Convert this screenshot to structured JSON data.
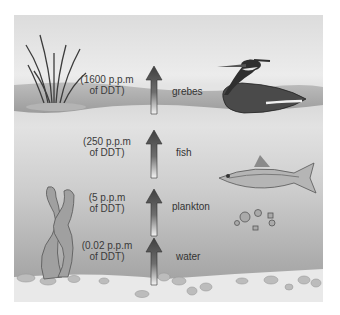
{
  "levels": [
    {
      "organism": "grebes",
      "concentration_line1": "(1600 p.p.m",
      "concentration_line2": "of DDT)"
    },
    {
      "organism": "fish",
      "concentration_line1": "(250 p.p.m",
      "concentration_line2": "of DDT)"
    },
    {
      "organism": "plankton",
      "concentration_line1": "(5 p.p.m",
      "concentration_line2": "of DDT)"
    },
    {
      "organism": "water",
      "concentration_line1": "(0.02 p.p.m",
      "concentration_line2": "of DDT)"
    }
  ],
  "icons": {
    "arrow": "up-arrow-icon",
    "reeds": "reeds-icon",
    "bird": "grebe-icon",
    "fish": "fish-icon",
    "plankton": "plankton-icon",
    "seaweed": "seaweed-icon"
  },
  "colors": {
    "sky": "#e6e6e6",
    "water_top": "#c6c6c6",
    "water_bottom": "#9e9e9e",
    "sediment": "#e8e8e8",
    "arrow": "#4a4a4a"
  }
}
